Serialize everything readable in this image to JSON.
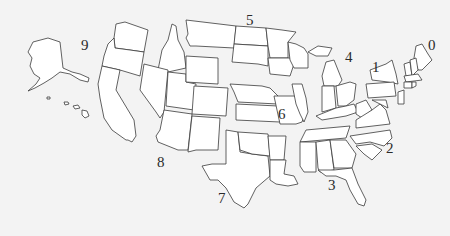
{
  "map": {
    "title": "US ZIP code regions",
    "background_color": "#f3f3f3",
    "state_fill": "#ffffff",
    "state_stroke": "#3a3a3a",
    "regions": [
      {
        "id": 0,
        "label": "0",
        "states": [
          "ME",
          "NH",
          "VT",
          "MA",
          "RI",
          "CT",
          "NJ"
        ]
      },
      {
        "id": 1,
        "label": "1",
        "states": [
          "NY",
          "PA",
          "DE"
        ]
      },
      {
        "id": 2,
        "label": "2",
        "states": [
          "DC",
          "MD",
          "VA",
          "WV",
          "NC",
          "SC"
        ]
      },
      {
        "id": 3,
        "label": "3",
        "states": [
          "AL",
          "FL",
          "GA",
          "MS",
          "TN"
        ]
      },
      {
        "id": 4,
        "label": "4",
        "states": [
          "IN",
          "KY",
          "MI",
          "OH"
        ]
      },
      {
        "id": 5,
        "label": "5",
        "states": [
          "IA",
          "MN",
          "MT",
          "ND",
          "SD",
          "WI"
        ]
      },
      {
        "id": 6,
        "label": "6",
        "states": [
          "IL",
          "KS",
          "MO",
          "NE"
        ]
      },
      {
        "id": 7,
        "label": "7",
        "states": [
          "AR",
          "LA",
          "OK",
          "TX"
        ]
      },
      {
        "id": 8,
        "label": "8",
        "states": [
          "AZ",
          "CO",
          "ID",
          "NM",
          "NV",
          "UT",
          "WY"
        ]
      },
      {
        "id": 9,
        "label": "9",
        "states": [
          "AK",
          "CA",
          "HI",
          "OR",
          "WA"
        ]
      }
    ]
  }
}
